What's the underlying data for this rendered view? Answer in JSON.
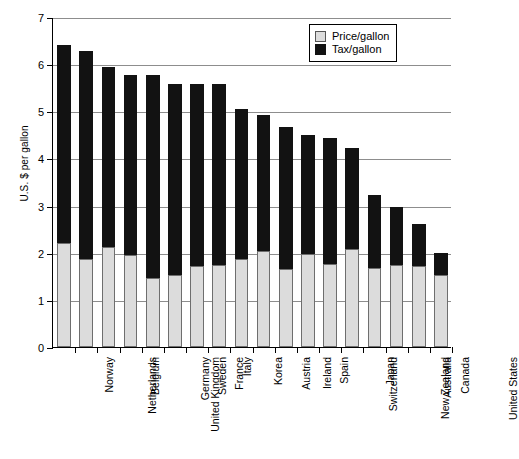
{
  "chart_data": {
    "type": "bar",
    "subtype": "stacked-vertical",
    "title": "",
    "xlabel": "",
    "ylabel": "U.S. $ per gallon",
    "ylim": [
      0,
      7
    ],
    "ytick_values": [
      0,
      1,
      2,
      3,
      4,
      5,
      6,
      7
    ],
    "ytick_labels": [
      "0",
      "1",
      "2",
      "3",
      "4",
      "5",
      "6",
      "7"
    ],
    "grid": true,
    "grid_axis": "y",
    "legend_position": "top-right",
    "categories": [
      "Norway",
      "Netherlands",
      "Belgium",
      "United Kingdom",
      "Germany",
      "Sweden",
      "France",
      "Italy",
      "Korea",
      "Austria",
      "Ireland",
      "Spain",
      "Switzerland",
      "Japan",
      "New Zealand",
      "Australia",
      "Canada",
      "United States"
    ],
    "series": [
      {
        "name": "Price/gallon",
        "color": "#dcdcdc",
        "values": [
          2.2,
          1.87,
          2.12,
          1.95,
          1.47,
          1.52,
          1.72,
          1.75,
          1.87,
          2.03,
          1.66,
          1.97,
          1.77,
          2.07,
          1.67,
          1.74,
          1.72,
          1.53
        ]
      },
      {
        "name": "Tax/gallon",
        "color": "#121212",
        "values": [
          4.2,
          4.4,
          3.81,
          3.83,
          4.3,
          4.05,
          3.85,
          3.82,
          3.18,
          2.89,
          3.01,
          2.53,
          2.66,
          2.16,
          1.55,
          1.23,
          0.88,
          0.47
        ]
      }
    ],
    "totals": [
      6.4,
      6.27,
      5.93,
      5.78,
      5.77,
      5.57,
      5.57,
      5.57,
      5.05,
      4.92,
      4.67,
      4.5,
      4.43,
      4.23,
      3.22,
      2.97,
      2.6,
      2.0
    ]
  },
  "legend": {
    "items": [
      {
        "label": "Price/gallon",
        "swatch": "price-swatch"
      },
      {
        "label": "Tax/gallon",
        "swatch": "tax-swatch"
      }
    ]
  }
}
